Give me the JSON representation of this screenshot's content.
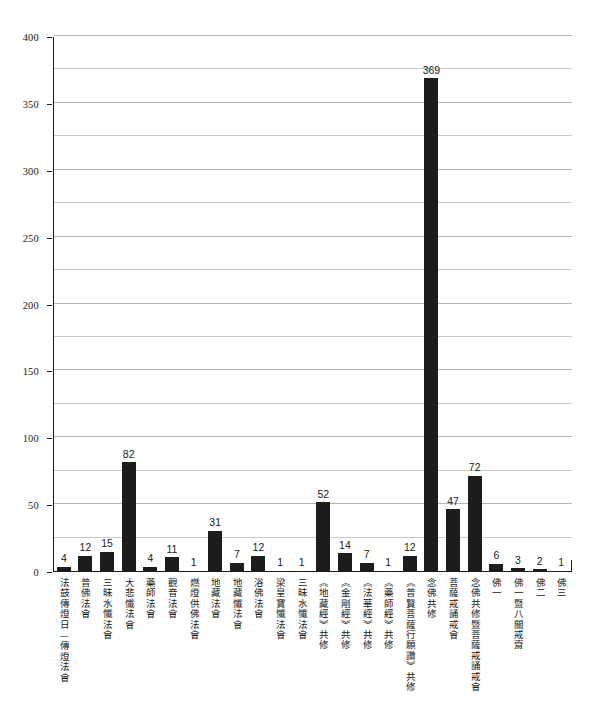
{
  "chart_data": {
    "type": "bar",
    "title": "",
    "subtitle": "",
    "xlabel": "",
    "ylabel": "",
    "ylim": [
      0,
      400
    ],
    "ytick_step": 50,
    "gridline_step": 25,
    "grid": true,
    "legend": "none",
    "orientation": "vertical",
    "bar_color": "#1d1d1d",
    "gridline_color": "#c9c9c9",
    "axis_color": "#1b1b1b",
    "background_color": "#ffffff",
    "show_value_labels": true,
    "ytick_labels": [
      "0",
      "50",
      "100",
      "150",
      "200",
      "250",
      "300",
      "350",
      "400"
    ],
    "ytick_values": [
      0,
      50,
      100,
      150,
      200,
      250,
      300,
      350,
      400
    ],
    "categories": [
      "法鼓傳燈日—傳燈法會",
      "普佛法會",
      "三昧水懺法會",
      "大悲懺法會",
      "藥師法會",
      "觀音法會",
      "燃燈供佛法會",
      "地藏法會",
      "地藏懺法會",
      "浴佛法會",
      "梁皇寶懺法會",
      "三昧水懺法會",
      "《地藏經》共修",
      "《金剛經》共修",
      "《法華經》共修",
      "《藥師經》共修",
      "《普賢菩薩行願讚》共修",
      "念佛共修",
      "菩薩戒誦戒會",
      "念佛共修暨菩薩戒誦戒會",
      "佛一",
      "佛一暨八關戒齋",
      "佛二",
      "佛三"
    ],
    "values": [
      4,
      12,
      15,
      82,
      4,
      11,
      1,
      31,
      7,
      12,
      1,
      1,
      52,
      14,
      7,
      1,
      12,
      369,
      47,
      72,
      6,
      3,
      2,
      1
    ]
  }
}
